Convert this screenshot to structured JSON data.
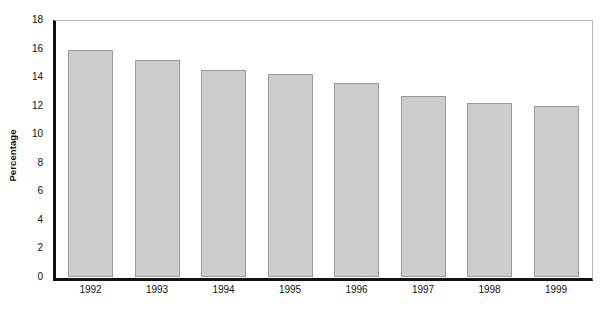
{
  "chart_data": {
    "type": "bar",
    "title": "",
    "xlabel": "",
    "ylabel": "Percentage",
    "categories": [
      "1992",
      "1993",
      "1994",
      "1995",
      "1996",
      "1997",
      "1998",
      "1999"
    ],
    "values": [
      15.9,
      15.2,
      14.5,
      14.2,
      13.6,
      12.7,
      12.2,
      12.0
    ],
    "ylim": [
      0,
      18
    ],
    "yticks": [
      0,
      2,
      4,
      6,
      8,
      10,
      12,
      14,
      16,
      18
    ],
    "ytick_labels": [
      "0",
      "2",
      "4",
      "6",
      "8",
      "10",
      "12",
      "14",
      "16",
      "18"
    ],
    "grid": false,
    "legend": "none",
    "bar_fill_color": "#cdcdcd",
    "bar_border_color": "#9a9a9a",
    "axis_color": "#111111",
    "frame_color": "#b8b8b8",
    "tick_color": "#8d8d8d",
    "background_color": "#ffffff"
  }
}
